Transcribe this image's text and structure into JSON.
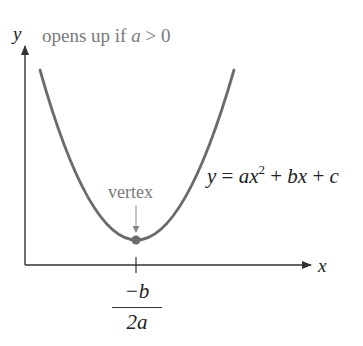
{
  "diagram": {
    "title_prefix": "opens up if ",
    "title_var": "a",
    "title_suffix": " > 0",
    "y_axis_label": "y",
    "x_axis_label": "x",
    "equation": {
      "lhs": "y",
      "eq": " = ",
      "a": "a",
      "x1": "x",
      "exp": "2",
      "plus1": " + ",
      "b": "b",
      "x2": "x",
      "plus2": " + ",
      "c": "c"
    },
    "vertex_label": "vertex",
    "tick_label": {
      "numerator": "−b",
      "denominator": "2a"
    },
    "colors": {
      "curve": "#6b6b6b",
      "axes": "#333333",
      "annotation_text": "#7a7a7a",
      "math_text": "#222222",
      "vertex_dot": "#6b6b6b"
    }
  }
}
